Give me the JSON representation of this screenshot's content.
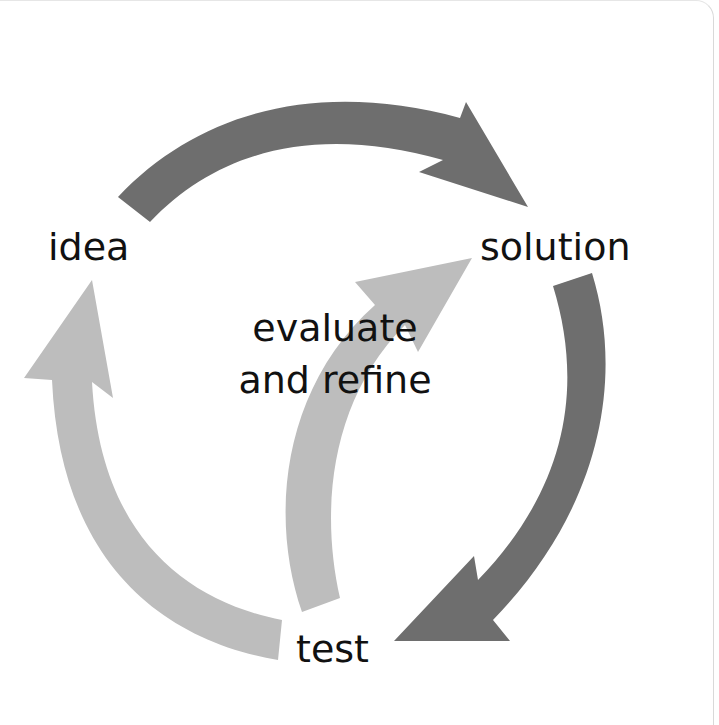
{
  "diagram": {
    "type": "cycle",
    "nodes": [
      {
        "id": "idea",
        "label": "idea"
      },
      {
        "id": "solution",
        "label": "solution"
      },
      {
        "id": "test",
        "label": "test"
      }
    ],
    "center_label": {
      "line1": "evaluate",
      "line2": "and refine"
    },
    "edges": [
      {
        "from": "idea",
        "to": "solution",
        "style": "dark",
        "color": "#6e6e6e"
      },
      {
        "from": "solution",
        "to": "test",
        "style": "dark",
        "color": "#6e6e6e"
      },
      {
        "from": "test",
        "to": "idea",
        "style": "light",
        "color": "#bdbdbd"
      },
      {
        "from": "test",
        "to": "solution",
        "style": "light",
        "color": "#bdbdbd"
      }
    ],
    "colors": {
      "dark_arrow": "#6e6e6e",
      "light_arrow": "#bdbdbd",
      "text": "#111111",
      "background": "#ffffff"
    }
  }
}
